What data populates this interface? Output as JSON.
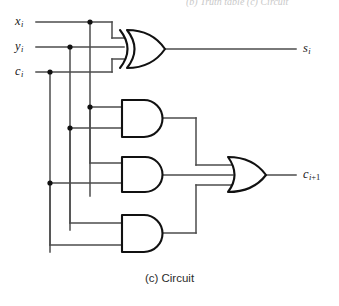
{
  "figure": {
    "caption": "(c) Circuit",
    "type": "logic-circuit-diagram",
    "cut_off_header": "(b) Truth table  (c) Circuit"
  },
  "colors": {
    "wire": "#4d4d4d",
    "gate_outline": "#111111",
    "gate_fill": "#ffffff",
    "junction": "#111111",
    "text": "#1a1a1a",
    "caption_text": "#2b2b2b",
    "background": "#ffffff"
  },
  "inputs": [
    {
      "id": "x",
      "base": "x",
      "sub": "i",
      "label": "x_i",
      "y": 22
    },
    {
      "id": "y",
      "base": "y",
      "sub": "i",
      "label": "y_i",
      "y": 47
    },
    {
      "id": "c",
      "base": "c",
      "sub": "i",
      "label": "c_i",
      "y": 72
    }
  ],
  "outputs": [
    {
      "id": "sum",
      "base": "s",
      "sub": "i",
      "label": "s_i",
      "y": 49
    },
    {
      "id": "carry",
      "base": "c",
      "sub": "i",
      "sub_extra": "+1",
      "label": "c_i+1",
      "y": 175
    }
  ],
  "gates": [
    {
      "id": "xor1",
      "type": "XOR",
      "inputs": [
        "x_i",
        "y_i",
        "c_i"
      ],
      "output": "s_i"
    },
    {
      "id": "and1",
      "type": "AND",
      "inputs": [
        "x_i",
        "y_i"
      ],
      "output": "to-or"
    },
    {
      "id": "and2",
      "type": "AND",
      "inputs": [
        "x_i",
        "c_i"
      ],
      "output": "to-or"
    },
    {
      "id": "and3",
      "type": "AND",
      "inputs": [
        "y_i",
        "c_i"
      ],
      "output": "to-or"
    },
    {
      "id": "or1",
      "type": "OR",
      "inputs": [
        "and1",
        "and2",
        "and3"
      ],
      "output": "c_i+1"
    }
  ],
  "junction_dots": [
    {
      "x": 90,
      "y": 22
    },
    {
      "x": 70,
      "y": 47
    },
    {
      "x": 50,
      "y": 72
    },
    {
      "x": 90,
      "y": 107
    },
    {
      "x": 70,
      "y": 128
    },
    {
      "x": 50,
      "y": 183
    }
  ]
}
